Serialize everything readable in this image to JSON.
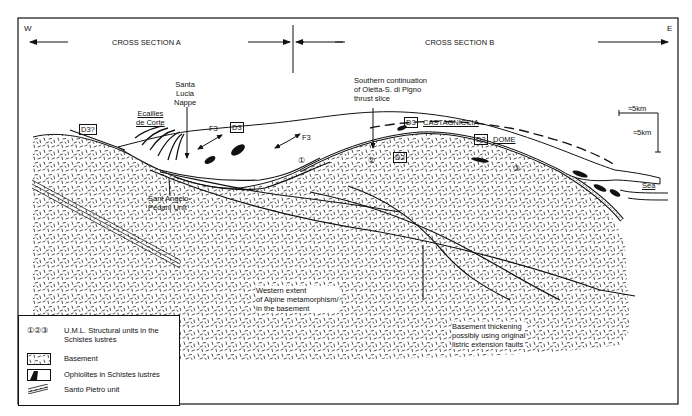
{
  "header": {
    "west": "W",
    "east": "E",
    "section_a": "CROSS SECTION  A",
    "section_b": "CROSS SECTION B"
  },
  "scale": {
    "horizontal": "≈5km",
    "vertical": "≈5km"
  },
  "labels": {
    "santa_lucia": [
      "Santa",
      "Lucia",
      "Nappe"
    ],
    "ecailles": [
      "Ecailles",
      "de Corte"
    ],
    "d3_question": "D3?",
    "d3_left": "D3",
    "f3_left": "F3",
    "f3_mid": "F3",
    "southern": [
      "Southern continuation",
      "of Oletta-S. di Pigno",
      "thrust slice"
    ],
    "d3_castagniccia_box": "D3",
    "castagniccia": "CASTAGNICCIA",
    "d2_dome_box": "D2",
    "dome": "DOME",
    "d2_inner": "D2",
    "unit_1": "①",
    "unit_2": "②",
    "unit_3": "③",
    "sea": "Sea",
    "sant_angelo": [
      "Sant  Angelo-",
      "Pedani Unit"
    ],
    "western_extent": [
      "Western extent",
      "of Alpine metamorphism/",
      "in the basement"
    ],
    "basement_thickening": [
      "Basement  thickening",
      "possibly using original",
      "listric extension faults"
    ]
  },
  "legend": {
    "items": [
      {
        "symbol": "①②③",
        "text": [
          "U.M.L. Structural units  in the",
          "Schistes lustrés"
        ]
      },
      {
        "symbol": "basement-pattern",
        "text": [
          "Basement"
        ]
      },
      {
        "symbol": "ophiolite-fill",
        "text": [
          "Ophiolites in  Schistes lustrés"
        ]
      },
      {
        "symbol": "santo-pietro-pattern",
        "text": [
          "Santo  Pietro unit"
        ]
      }
    ]
  },
  "colors": {
    "ink": "#111111",
    "paper": "#ffffff"
  }
}
